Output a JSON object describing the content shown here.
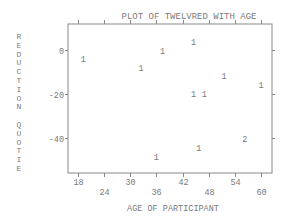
{
  "chart_data": {
    "type": "scatter",
    "title": "PLOT OF TWELVRED WITH AGE",
    "xlabel": "AGE OF PARTICIPANT",
    "ylabel": "REDUCTION QUOTIE",
    "xlim": [
      16.5,
      63
    ],
    "ylim": [
      -56,
      11
    ],
    "x_ticks": [
      18,
      24,
      30,
      36,
      42,
      48,
      54,
      60
    ],
    "y_ticks": [
      0,
      -20,
      -40
    ],
    "grid": false,
    "legend": "none",
    "marker_style": "count digits (number of coincident points)",
    "points": [
      {
        "x": 19.2,
        "y": -4,
        "label": "1"
      },
      {
        "x": 32.5,
        "y": -8,
        "label": "1"
      },
      {
        "x": 37.4,
        "y": -0.5,
        "label": "1"
      },
      {
        "x": 44.5,
        "y": 3.5,
        "label": "1"
      },
      {
        "x": 51.5,
        "y": -12,
        "label": "1"
      },
      {
        "x": 60,
        "y": -16,
        "label": "1"
      },
      {
        "x": 44.5,
        "y": -20,
        "label": "1"
      },
      {
        "x": 47,
        "y": -20,
        "label": "1"
      },
      {
        "x": 36,
        "y": -48.5,
        "label": "1"
      },
      {
        "x": 45.7,
        "y": -44.5,
        "label": "1"
      },
      {
        "x": 56.3,
        "y": -40.5,
        "label": "2"
      }
    ]
  },
  "colors": {
    "frame": "#8a8a8a",
    "text": "#7a7a7a"
  }
}
